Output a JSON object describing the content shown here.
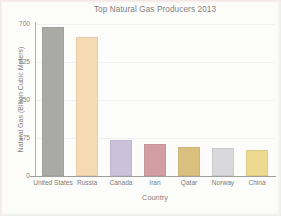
{
  "chart_data": {
    "type": "bar",
    "title": "Top Natural Gas Producers 2013",
    "xlabel": "Country",
    "ylabel": "Natural Gas (Billion Cubic Meters)",
    "categories": [
      "United States",
      "Russia",
      "Canada",
      "Iran",
      "Qatar",
      "Norway",
      "China"
    ],
    "values": [
      685,
      640,
      165,
      148,
      133,
      127,
      122
    ],
    "colors": [
      "#7f7f7a",
      "#f5c98f",
      "#b4a3cc",
      "#bf6c78",
      "#c9a23e",
      "#c8c8ce",
      "#e6c85a"
    ],
    "ylim": [
      0,
      700
    ],
    "yticks": [
      0,
      175,
      350,
      525,
      700
    ],
    "ytick_labels": [
      "0",
      "175",
      "350",
      "525",
      "700"
    ],
    "grid": true,
    "legend": "none",
    "series": [
      {
        "name": "Natural Gas Production 2013",
        "values": [
          685,
          640,
          165,
          148,
          133,
          127,
          122
        ]
      }
    ],
    "points": [
      {
        "category": "United States",
        "value": 685,
        "color": "#7f7f7a"
      },
      {
        "category": "Russia",
        "value": 640,
        "color": "#f5c98f"
      },
      {
        "category": "Canada",
        "value": 165,
        "color": "#b4a3cc"
      },
      {
        "category": "Iran",
        "value": 148,
        "color": "#bf6c78"
      },
      {
        "category": "Qatar",
        "value": 133,
        "color": "#c9a23e"
      },
      {
        "category": "Norway",
        "value": 127,
        "color": "#c8c8ce"
      },
      {
        "category": "China",
        "value": 122,
        "color": "#e6c85a"
      }
    ]
  }
}
